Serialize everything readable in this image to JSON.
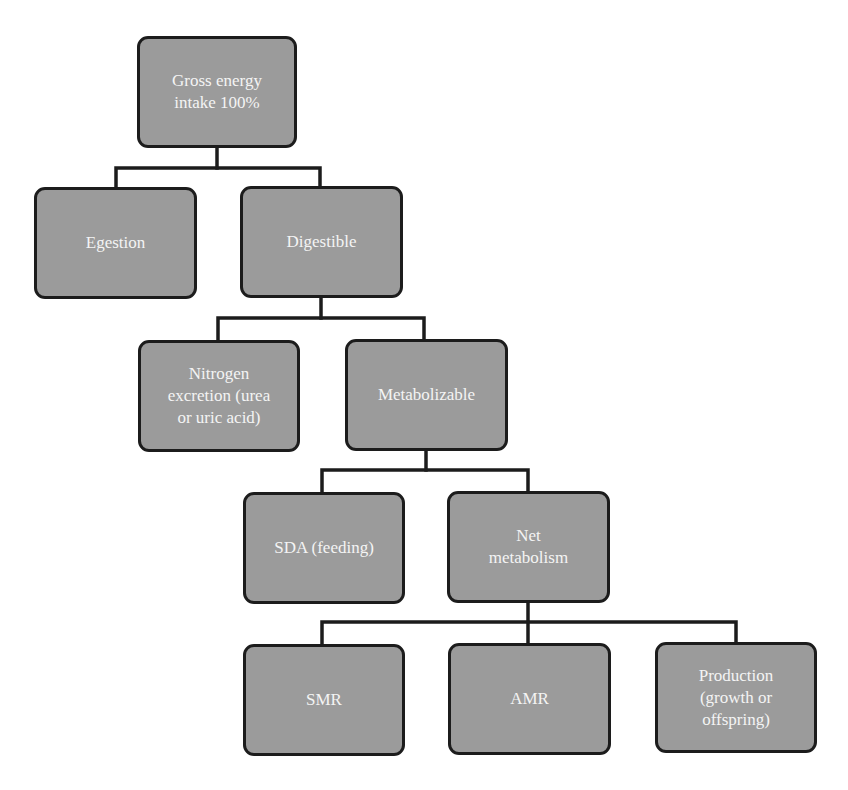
{
  "diagram": {
    "type": "tree",
    "colors": {
      "node_fill": "#9b9b9b",
      "node_border": "#1c1c1c",
      "node_text": "#f4f4f4",
      "connector": "#1c1c1c",
      "background": "#ffffff"
    },
    "nodes": {
      "gross": {
        "label": "Gross energy\nintake 100%"
      },
      "egestion": {
        "label": "Egestion"
      },
      "digestible": {
        "label": "Digestible"
      },
      "nitrogen": {
        "label": "Nitrogen\nexcretion (urea\nor uric acid)"
      },
      "metabolizable": {
        "label": "Metabolizable"
      },
      "sda": {
        "label": "SDA (feeding)"
      },
      "net": {
        "label": "Net\nmetabolism"
      },
      "smr": {
        "label": "SMR"
      },
      "amr": {
        "label": "AMR"
      },
      "production": {
        "label": "Production\n(growth or\noffspring)"
      }
    },
    "edges": [
      [
        "gross",
        "egestion"
      ],
      [
        "gross",
        "digestible"
      ],
      [
        "digestible",
        "nitrogen"
      ],
      [
        "digestible",
        "metabolizable"
      ],
      [
        "metabolizable",
        "sda"
      ],
      [
        "metabolizable",
        "net"
      ],
      [
        "net",
        "smr"
      ],
      [
        "net",
        "amr"
      ],
      [
        "net",
        "production"
      ]
    ]
  }
}
